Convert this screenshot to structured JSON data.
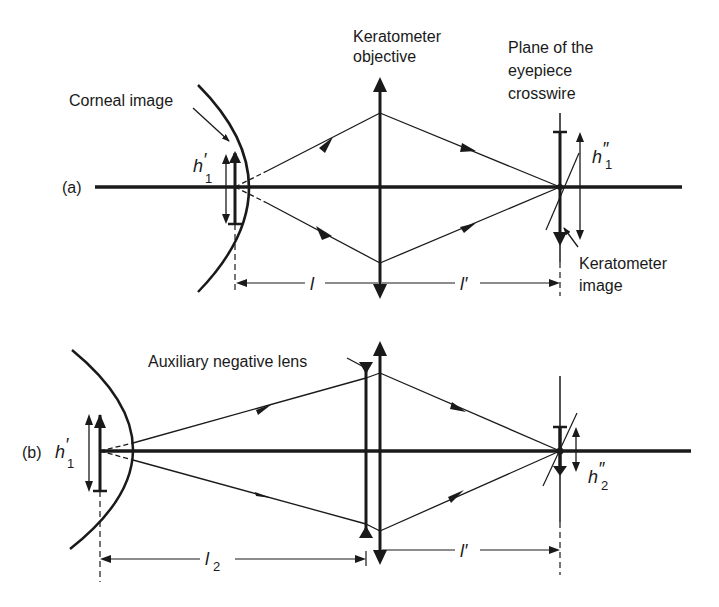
{
  "figure": {
    "panel_a": {
      "label": "(a)",
      "corneal_image_label": "Corneal image",
      "objective_label_line1": "Keratometer",
      "objective_label_line2": "objective",
      "crosswire_label_line1": "Plane of the",
      "crosswire_label_line2": "eyepiece",
      "crosswire_label_line3": "crosswire",
      "keratometer_image_line1": "Keratometer",
      "keratometer_image_line2": "image",
      "h_object": "h",
      "h_object_sub": "1",
      "h_object_prime": "′",
      "h_image": "h",
      "h_image_sub": "1",
      "h_image_prime": "″",
      "dist_object": "l",
      "dist_image": "l′"
    },
    "panel_b": {
      "label": "(b)",
      "aux_lens_label": "Auxiliary negative lens",
      "h_object": "h",
      "h_object_sub": "1",
      "h_object_prime": "′",
      "h_image": "h",
      "h_image_sub": "2",
      "h_image_prime": "″",
      "dist_object": "l",
      "dist_object_sub": "2",
      "dist_image": "l′"
    },
    "colors": {
      "ink": "#1a1a1a",
      "background": "#ffffff"
    }
  }
}
